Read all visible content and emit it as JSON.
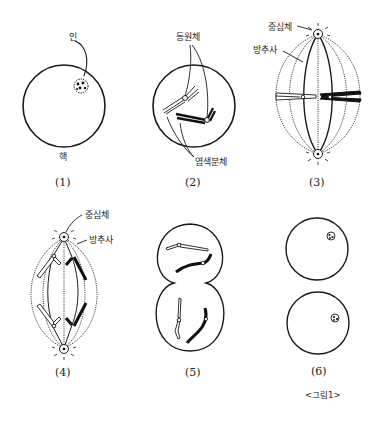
{
  "figure_title": "<그림1>",
  "colors": {
    "stroke": "#1a1a1a",
    "background": "#ffffff",
    "chromosome_dark": "#111111"
  },
  "panels": [
    {
      "id": "1",
      "caption": "(1)",
      "labels": {
        "nucleolus": "인",
        "nucleus": "핵"
      }
    },
    {
      "id": "2",
      "caption": "(2)",
      "labels": {
        "centromere": "동원체",
        "chromatid": "염색분체"
      }
    },
    {
      "id": "3",
      "caption": "(3)",
      "labels": {
        "centrosome": "중심체",
        "spindle": "방추사"
      }
    },
    {
      "id": "4",
      "caption": "(4)",
      "labels": {
        "centrosome": "중심체",
        "spindle": "방추사"
      }
    },
    {
      "id": "5",
      "caption": "(5)",
      "labels": {}
    },
    {
      "id": "6",
      "caption": "(6)",
      "labels": {}
    }
  ]
}
